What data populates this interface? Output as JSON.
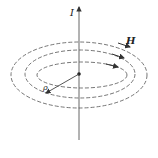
{
  "diagram": {
    "labels": {
      "current": "I",
      "field": "H",
      "radius": "ρ"
    },
    "elements": {
      "wire": "vertical line with upward arrow",
      "field_lines": "three concentric dashed ellipses with direction arrows",
      "radius_vector": "arrow from center to inner ellipse labeled ρ"
    },
    "colors": {
      "line": "#555555",
      "background": "#ffffff"
    }
  }
}
